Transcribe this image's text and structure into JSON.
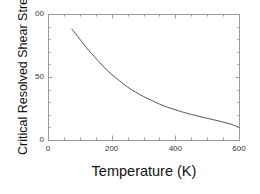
{
  "chart_data": {
    "type": "line",
    "title": "",
    "xlabel": "Temperature (K)",
    "ylabel": "Critical Resolved Shear Stress",
    "xlim": [
      0,
      600
    ],
    "ylim": [
      0,
      100
    ],
    "xticks": [
      0,
      200,
      400,
      600
    ],
    "xtick_labels": [
      "0",
      "200",
      "400",
      "600"
    ],
    "yticks": [
      0,
      50,
      100
    ],
    "ytick_labels": [
      "0",
      "50",
      "00"
    ],
    "ytick_labels_note": "top label rendered as '00' (leading digit clipped at image edge)",
    "x_minor_tick_interval": 50,
    "y_minor_tick_interval": 10,
    "grid": false,
    "legend": null,
    "series": [
      {
        "name": "Critical Resolved Shear Stress",
        "color": "#555555",
        "line_width": 1,
        "x": [
          75,
          100,
          125,
          150,
          175,
          200,
          225,
          250,
          275,
          300,
          325,
          350,
          375,
          400,
          425,
          450,
          475,
          500,
          525,
          550,
          575,
          600
        ],
        "y": [
          88,
          80,
          72,
          65,
          58,
          52,
          47,
          42,
          38,
          34.5,
          31.5,
          28.5,
          26,
          24,
          22,
          20.3,
          18.7,
          17.2,
          15.8,
          14.2,
          12.5,
          10
        ]
      }
    ],
    "frame": {
      "left_px": 48,
      "right_px": 239,
      "top_px": 14,
      "bottom_px": 140,
      "border_color": "#9a9a9a",
      "background": "#ffffff"
    }
  },
  "figure": {
    "background_color": "#ffffff",
    "text_color": "#111111"
  }
}
